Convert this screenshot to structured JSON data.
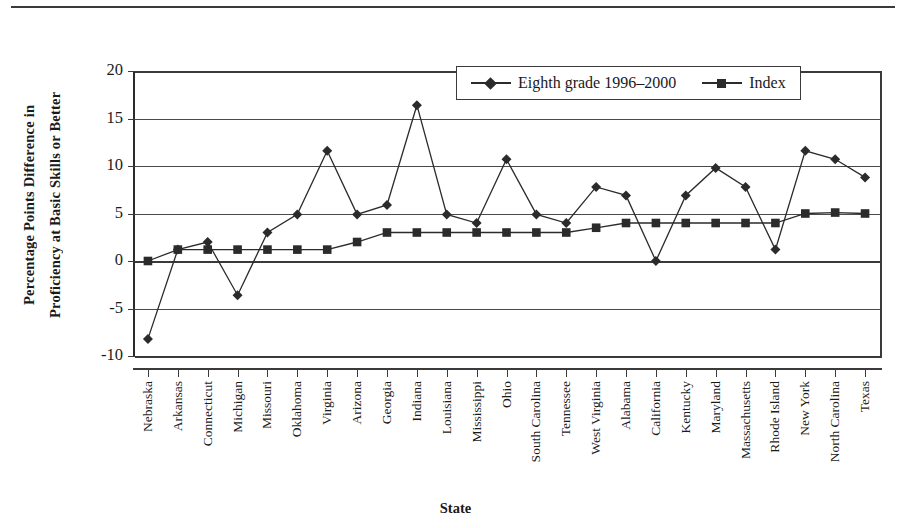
{
  "chart_data": {
    "type": "line",
    "title": "",
    "xlabel": "State",
    "ylabel_line1": "Percentage Points Difference in",
    "ylabel_line2": "Proficiency at Basic Skills or Better",
    "ylim": [
      -10,
      20
    ],
    "yticks": [
      20,
      15,
      10,
      5,
      0,
      -5,
      -10
    ],
    "ytick_labels": [
      "20",
      "15",
      "10",
      "5",
      "0",
      "-5",
      "-10"
    ],
    "grid": true,
    "legend_position": "top-right-inside",
    "categories": [
      "Nebraska",
      "Arkansas",
      "Connecticut",
      "Michigan",
      "Missouri",
      "Oklahoma",
      "Virginia",
      "Arizona",
      "Georgia",
      "Indiana",
      "Louisiana",
      "Mississippi",
      "Ohio",
      "South Carolina",
      "Tennessee",
      "West Virginia",
      "Alabama",
      "California",
      "Kentucky",
      "Maryland",
      "Massachusetts",
      "Rhode Island",
      "New York",
      "North Carolina",
      "Texas"
    ],
    "series": [
      {
        "name": "Eighth grade 1996-2000",
        "marker": "diamond",
        "values": [
          -8.2,
          1.2,
          2.0,
          -3.6,
          3.0,
          4.9,
          11.6,
          4.9,
          5.9,
          16.4,
          4.9,
          4.0,
          10.7,
          4.9,
          4.0,
          7.8,
          6.9,
          0.0,
          6.9,
          9.8,
          7.8,
          1.2,
          11.6,
          10.7,
          8.8
        ]
      },
      {
        "name": "Index",
        "marker": "square",
        "values": [
          0.0,
          1.2,
          1.2,
          1.2,
          1.2,
          1.2,
          1.2,
          2.0,
          3.0,
          3.0,
          3.0,
          3.0,
          3.0,
          3.0,
          3.0,
          3.5,
          4.0,
          4.0,
          4.0,
          4.0,
          4.0,
          4.0,
          5.0,
          5.1,
          5.0
        ]
      }
    ]
  },
  "legend": {
    "items": [
      {
        "label": "Eighth grade 1996–2000",
        "marker": "diamond"
      },
      {
        "label": "Index",
        "marker": "square"
      }
    ]
  },
  "axes": {
    "x_title": "State",
    "y_title_line1": "Percentage Points Difference in",
    "y_title_line2": "Proficiency at Basic Skills or Better"
  },
  "colors": {
    "series_line": "#2b2b2b",
    "grid": "#4a4a4a",
    "axis": "#3a3a3a",
    "background": "#ffffff"
  }
}
